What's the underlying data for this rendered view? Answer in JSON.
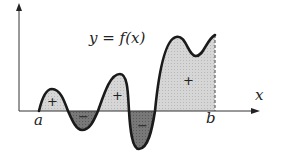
{
  "diagram": {
    "title": "y = f(x)",
    "axes": {
      "x_label": "x",
      "y_label": ""
    },
    "bounds": {
      "a": "a",
      "b": "b"
    },
    "regions": [
      {
        "sign": "+",
        "position": "first hump"
      },
      {
        "sign": "−",
        "position": "first trough"
      },
      {
        "sign": "+",
        "position": "second hump"
      },
      {
        "sign": "−",
        "position": "deep trough"
      },
      {
        "sign": "+",
        "position": "large region up to b"
      }
    ],
    "colors": {
      "positive_fill": "#d0d0d0",
      "negative_fill": "#707070",
      "curve": "#1a1a1a",
      "axis": "#333333"
    }
  }
}
